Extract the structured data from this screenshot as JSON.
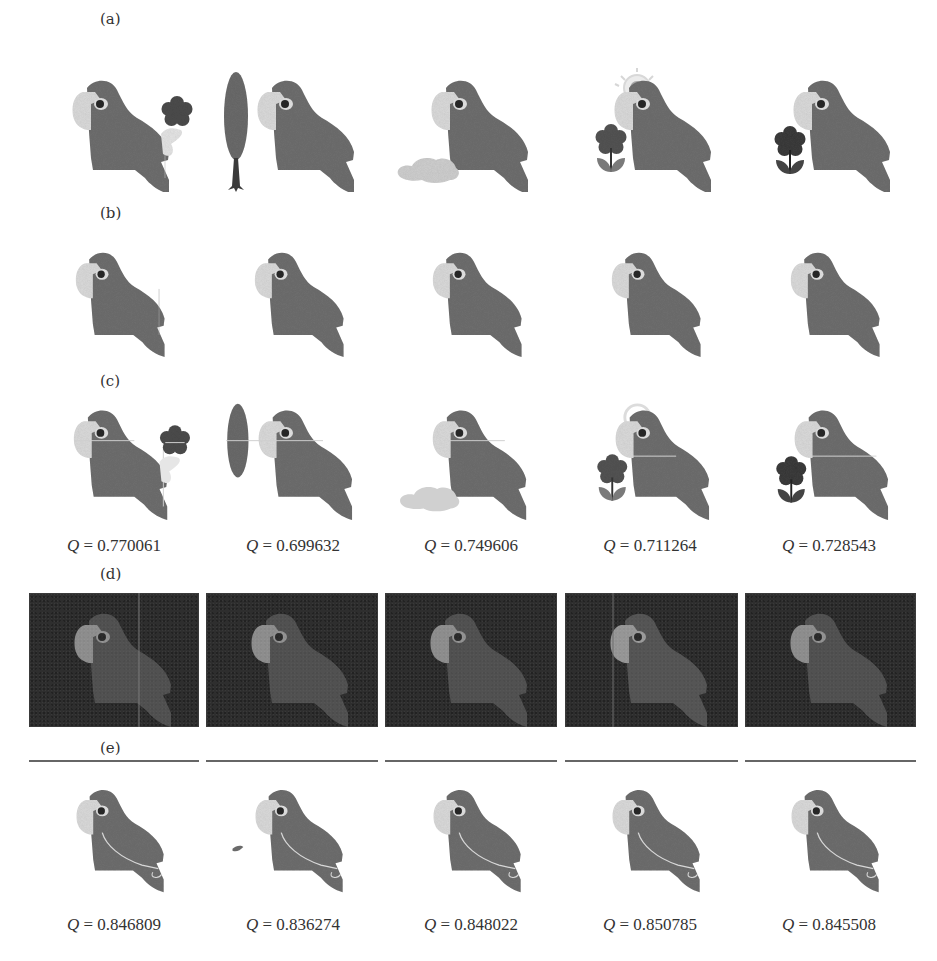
{
  "figure": {
    "row_labels": {
      "a": "(a)",
      "b": "(b)",
      "c": "(c)",
      "d": "(d)",
      "e": "(e)"
    },
    "rows": {
      "a": {
        "description": "Input images: parrot with varying distractor objects",
        "items": [
          {
            "distractor": "flower-pale-stem"
          },
          {
            "distractor": "tall-leaf"
          },
          {
            "distractor": "cloud"
          },
          {
            "distractor": "sun-and-flower"
          },
          {
            "distractor": "dark-flower"
          }
        ]
      },
      "b": {
        "description": "Ground truth parrot silhouettes",
        "items": [
          {},
          {},
          {},
          {},
          {}
        ]
      },
      "c": {
        "description": "Segmentation results (method 1)",
        "q_prefix": "Q = ",
        "q_values": [
          "0.770061",
          "0.699632",
          "0.749606",
          "0.711264",
          "0.728543"
        ]
      },
      "d": {
        "description": "Intermediate response maps (dark panels)",
        "items": [
          {},
          {},
          {},
          {},
          {}
        ]
      },
      "e": {
        "description": "Segmentation results (method 2)",
        "q_prefix": "Q = ",
        "q_values": [
          "0.846809",
          "0.836274",
          "0.848022",
          "0.850785",
          "0.845508"
        ]
      }
    },
    "colors": {
      "parrot_body": "#6f6f6f",
      "parrot_face": "#dcdcdc",
      "parrot_eye": "#2a2a2a",
      "dark_panel": "#2e2e2e",
      "flower_dark": "#4a4a4a",
      "cloud": "#cfcfcf"
    }
  }
}
